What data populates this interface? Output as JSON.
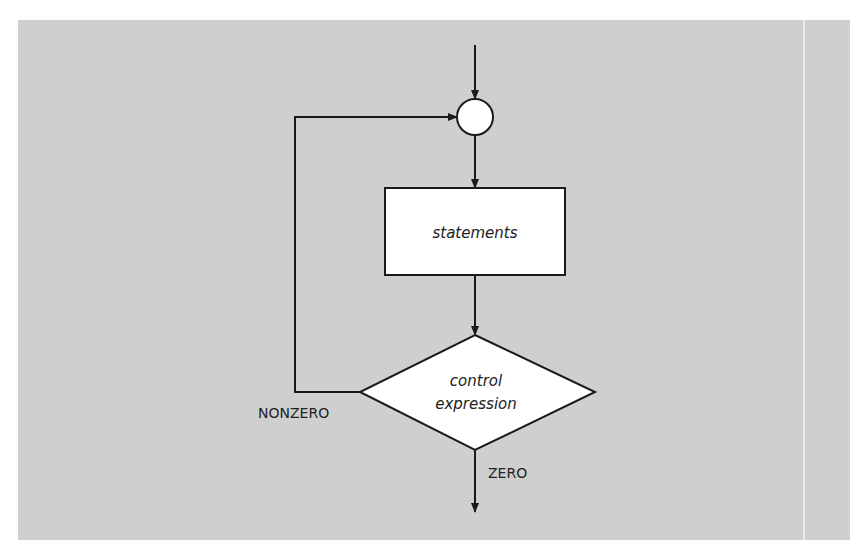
{
  "diagram": {
    "type": "flowchart",
    "nodes": {
      "junction": {
        "shape": "circle",
        "label": ""
      },
      "statements": {
        "shape": "rectangle",
        "label": "statements"
      },
      "control": {
        "shape": "diamond",
        "label_line1": "control",
        "label_line2": "expression"
      }
    },
    "edges": {
      "nonzero_label": "NONZERO",
      "zero_label": "ZERO"
    },
    "colors": {
      "background": "#cfcfcf",
      "node_fill": "#ffffff",
      "stroke": "#1a1a1a"
    }
  }
}
